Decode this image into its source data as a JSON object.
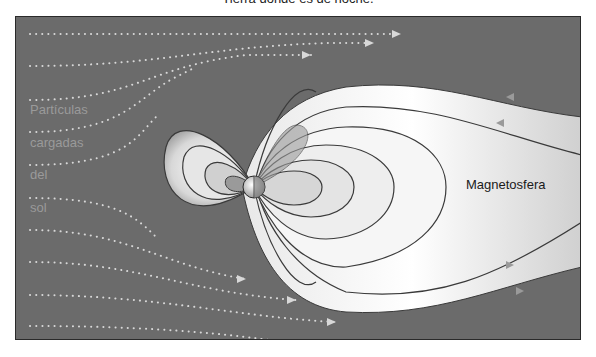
{
  "caption": "Tierra donde es de noche.",
  "diagram": {
    "labels": {
      "solar_wind": [
        "Partículas",
        "cargadas",
        "del",
        "sol"
      ],
      "magnetosphere": "Magnetosfera"
    },
    "colors": {
      "background": "#6b6b6b",
      "field_light": "#f2f2f2",
      "field_line": "#3a3a3a",
      "particle_dots": "#d8d8d8",
      "left_label": "#9a9a9a"
    },
    "icons": [
      "earth-globe-icon",
      "arrow-right-icon"
    ]
  }
}
